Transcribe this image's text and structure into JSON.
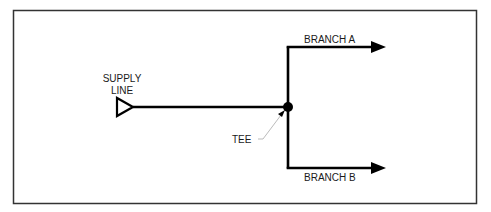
{
  "diagram": {
    "frame": {
      "x": 13,
      "y": 10,
      "width": 463,
      "height": 193,
      "stroke": "#333333"
    },
    "supply": {
      "label_line1": "SUPPLY",
      "label_line2": "LINE"
    },
    "tee": {
      "label": "TEE"
    },
    "branches": [
      {
        "label": "BRANCH A"
      },
      {
        "label": "BRANCH B"
      }
    ],
    "colors": {
      "line": "#000000",
      "leader": "#bbbbbb",
      "text": "#1a1a1a"
    }
  }
}
